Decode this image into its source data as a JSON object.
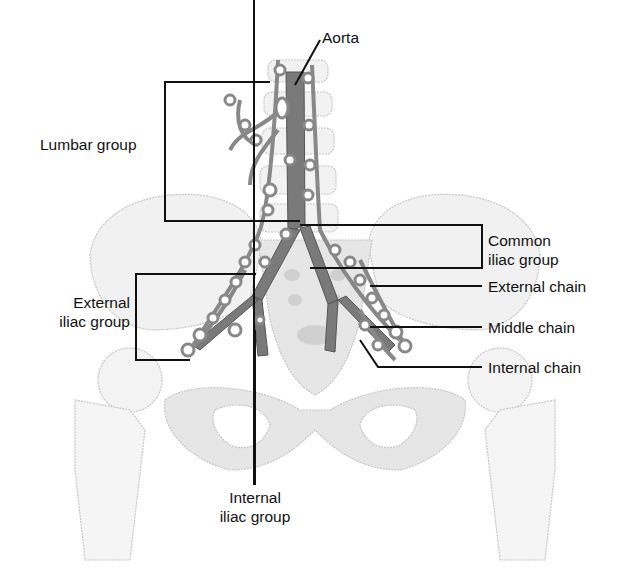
{
  "diagram": {
    "labels": {
      "aorta": "Aorta",
      "lumbar_group": "Lumbar group",
      "common_iliac_line1": "Common",
      "common_iliac_line2": "iliac group",
      "external_chain": "External chain",
      "middle_chain": "Middle chain",
      "internal_chain": "Internal chain",
      "external_iliac_line1": "External",
      "external_iliac_line2": "iliac group",
      "internal_iliac_line1": "Internal",
      "internal_iliac_line2": "iliac group"
    },
    "colors": {
      "line": "#111111",
      "vessel": "#777777",
      "node": "#8a8a8a",
      "bone_outline": "#c8c8c8",
      "bone_fill": "#ececec"
    }
  }
}
